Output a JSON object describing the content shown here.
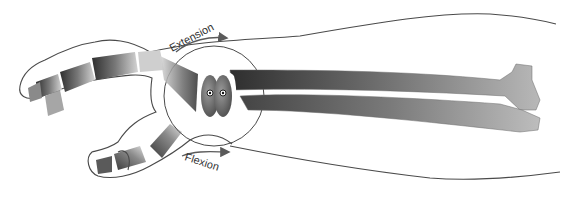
{
  "diagram": {
    "labels": {
      "extension": "Extension",
      "flexion": "Flexion"
    },
    "structures": [
      {
        "name": "forearm-outline"
      },
      {
        "name": "radius-bone"
      },
      {
        "name": "ulna-bone"
      },
      {
        "name": "carpal-bones"
      },
      {
        "name": "metacarpals"
      },
      {
        "name": "finger-phalanges"
      },
      {
        "name": "thumb"
      },
      {
        "name": "pivot-axes",
        "count": 2
      },
      {
        "name": "motion-arc-circle"
      }
    ],
    "arrows": [
      {
        "label": "Extension",
        "direction": "right",
        "position": "upper"
      },
      {
        "label": "Flexion",
        "direction": "right",
        "position": "lower"
      }
    ],
    "colors": {
      "background": "#ffffff",
      "outline": "#4a4a4a",
      "bone_dark": "#3a3a3a",
      "bone_light": "#c8c8c8",
      "text": "#333333"
    }
  }
}
